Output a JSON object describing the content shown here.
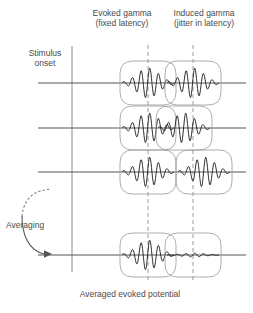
{
  "headers": {
    "evoked": "Evoked gamma\n(fixed latency)",
    "evoked_line1": "Evoked gamma",
    "evoked_line2": "(fixed latency)",
    "induced_line1": "Induced gamma",
    "induced_line2": "(jitter in latency)"
  },
  "labels": {
    "stimulus_line1": "Stimulus",
    "stimulus_line2": "onset",
    "averaging": "Averaging",
    "caption": "Averaged evoked potential"
  },
  "colors": {
    "background": "#ffffff",
    "trace": "#555555",
    "burst": "#1a1a1a",
    "packet_outline": "#9a9a9a",
    "dashed_guide": "#9a9a9a",
    "text": "#4a4a4a"
  },
  "chart_data": {
    "type": "line",
    "xlabel": "",
    "ylabel": "",
    "guides": {
      "stimulus_onset_x": 72,
      "evoked_guide_x": 148,
      "induced_guide_x": 193
    },
    "rows": [
      {
        "name": "trial-1",
        "y": 83,
        "evoked_offset": 0,
        "induced_offset": 0,
        "evoked_amp": 1.0,
        "induced_amp": 1.0
      },
      {
        "name": "trial-2",
        "y": 128,
        "evoked_offset": 0,
        "induced_offset": -9,
        "evoked_amp": 1.0,
        "induced_amp": 1.0
      },
      {
        "name": "trial-3",
        "y": 172,
        "evoked_offset": 0,
        "induced_offset": 11,
        "evoked_amp": 1.0,
        "induced_amp": 1.0
      },
      {
        "name": "average",
        "y": 255,
        "evoked_offset": 0,
        "induced_offset": 0,
        "evoked_amp": 1.0,
        "induced_amp": 0.13
      }
    ],
    "series": [
      {
        "name": "Evoked gamma burst amplitude per trial",
        "categories": [
          "trial-1",
          "trial-2",
          "trial-3",
          "average"
        ],
        "values": [
          1.0,
          1.0,
          1.0,
          1.0
        ]
      },
      {
        "name": "Induced gamma burst amplitude per trial",
        "categories": [
          "trial-1",
          "trial-2",
          "trial-3",
          "average"
        ],
        "values": [
          1.0,
          1.0,
          1.0,
          0.13
        ]
      },
      {
        "name": "Induced gamma latency jitter (px)",
        "categories": [
          "trial-1",
          "trial-2",
          "trial-3",
          "average"
        ],
        "values": [
          0,
          -9,
          11,
          0
        ]
      }
    ]
  }
}
